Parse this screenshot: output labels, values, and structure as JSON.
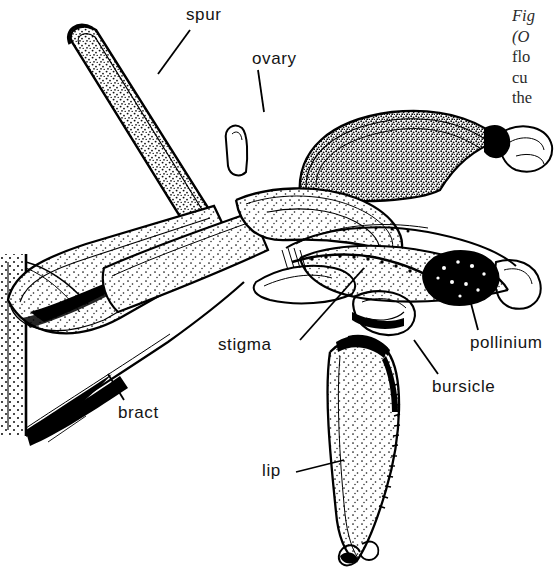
{
  "figure": {
    "kind": "botanical-line-illustration",
    "ink_color": "#000000",
    "background_color": "#ffffff"
  },
  "labels": {
    "spur": "spur",
    "ovary": "ovary",
    "stigma": "stigma",
    "bract": "bract",
    "bursicle": "bursicle",
    "pollinium": "pollinium",
    "lip": "lip"
  },
  "caption": {
    "clipped": true,
    "lines": [
      {
        "text": "Fig",
        "italic": true
      },
      {
        "text": "(O",
        "italic": true
      },
      {
        "text": "flo",
        "italic": false
      },
      {
        "text": "cu",
        "italic": false
      },
      {
        "text": "the",
        "italic": false
      }
    ]
  }
}
